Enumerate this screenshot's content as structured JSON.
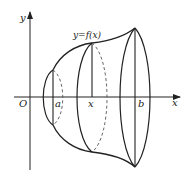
{
  "diagram": {
    "type": "solid-of-revolution",
    "labels": {
      "y_axis": "y",
      "x_axis": "x",
      "origin": "O",
      "a": "a",
      "x": "x",
      "b": "b",
      "curve": "y=f(x)"
    },
    "colors": {
      "stroke": "#222222",
      "dashed": "#555555",
      "background": "#ffffff"
    }
  }
}
